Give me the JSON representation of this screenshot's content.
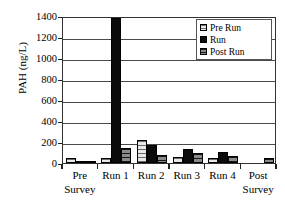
{
  "chart_data": {
    "type": "bar",
    "title": "",
    "xlabel": "",
    "ylabel": "PAH (ng/L)",
    "ylim": [
      0,
      1400
    ],
    "ytick_labels": [
      "0",
      "200",
      "400",
      "600",
      "800",
      "1000",
      "1200",
      "1400"
    ],
    "ytick_values": [
      0,
      200,
      400,
      600,
      800,
      1000,
      1200,
      1400
    ],
    "grid": true,
    "legend_position": "top-right",
    "categories": [
      "Pre Survey",
      "Run 1",
      "Run 2",
      "Run 3",
      "Run 4",
      "Post Survey"
    ],
    "category_lines": [
      [
        "Pre",
        "Survey"
      ],
      [
        "Run 1",
        ""
      ],
      [
        "Run 2",
        ""
      ],
      [
        "Run 3",
        ""
      ],
      [
        "Run 4",
        ""
      ],
      [
        "Post",
        "Survey"
      ]
    ],
    "series": [
      {
        "name": "Pre Run",
        "values": [
          50,
          48,
          220,
          55,
          45,
          0
        ]
      },
      {
        "name": "Run",
        "values": [
          8,
          1380,
          170,
          130,
          105,
          0
        ]
      },
      {
        "name": "Post Run",
        "values": [
          10,
          140,
          75,
          100,
          70,
          50
        ]
      }
    ]
  },
  "legend": {
    "items": [
      {
        "label": "Pre Run"
      },
      {
        "label": "Run"
      },
      {
        "label": "Post Run"
      }
    ]
  }
}
